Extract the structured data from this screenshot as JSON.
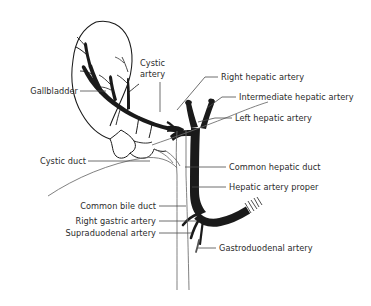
{
  "figure": {
    "background_color": "#ffffff",
    "ink_color": "#1a1a1a",
    "text_color": "#2b2b2b",
    "width": 371,
    "height": 306
  },
  "labels": {
    "gallbladder": "Gallbladder",
    "cystic_artery_line1": "Cystic",
    "cystic_artery_line2": "artery",
    "right_hepatic_artery": "Right hepatic artery",
    "intermediate_hepatic_artery": "Intermediate hepatic artery",
    "left_hepatic_artery": "Left hepatic artery",
    "cystic_duct": "Cystic duct",
    "common_hepatic_duct": "Common hepatic duct",
    "hepatic_artery_proper": "Hepatic artery proper",
    "common_bile_duct": "Common bile duct",
    "right_gastric_artery": "Right gastric artery",
    "supraduodenal_artery": "Supraduodenal artery",
    "gastroduodenal_artery": "Gastroduodenal artery"
  }
}
